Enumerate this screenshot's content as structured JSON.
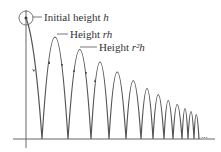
{
  "labels": {
    "initial": {
      "text": "Initial height ",
      "var": "h"
    },
    "first": {
      "text": "Height ",
      "var": "rh"
    },
    "second": {
      "text": "Height ",
      "var": "r²h"
    }
  },
  "ellipsis": "...",
  "colors": {
    "curve": "#555555",
    "axis": "#666666",
    "text": "#333333"
  }
}
